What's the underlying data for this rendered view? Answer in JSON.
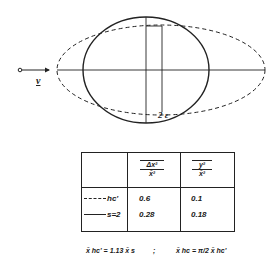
{
  "figure": {
    "velocity_label": "v",
    "radius_label": "2ε",
    "shapes": [
      {
        "name": "solid-circle",
        "style": "solid",
        "cx": 146,
        "cy": 70,
        "rx": 63,
        "ry": 53
      },
      {
        "name": "dashed-ellipse",
        "style": "dashed",
        "cx": 161,
        "cy": 70,
        "rx": 104,
        "ry": 45
      }
    ]
  },
  "table": {
    "headers": [
      {
        "num": "Δx²",
        "den": "x̄²"
      },
      {
        "num": "y²",
        "den": "x̄²"
      }
    ],
    "rows": [
      {
        "legend_style": "dashed",
        "label": "hc'",
        "values": [
          "0.6",
          "0.1"
        ]
      },
      {
        "legend_style": "solid",
        "label": "s=2",
        "values": [
          "0.28",
          "0.18"
        ]
      }
    ]
  },
  "formulas": {
    "left": "x̄ hc' = 1.13 x̄ s",
    "separator": ";",
    "right": "x̄ hc = π/2 x̄ hc'"
  }
}
